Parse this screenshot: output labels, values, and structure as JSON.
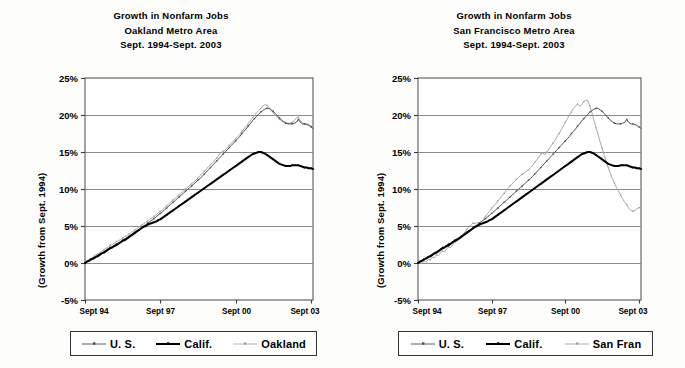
{
  "document": {
    "background_color": "#fdfdfb",
    "ink_color": "#000000"
  },
  "panels": [
    {
      "id": "oakland",
      "title_line1": "Growth in Nonfarm Jobs",
      "title_line2": "Oakland Metro Area",
      "title_line3": "Sept. 1994-Sept. 2003",
      "ylabel": "(Growth from Sept. 1994)",
      "legend": [
        {
          "label": "U. S.",
          "color": "#4d4d4d",
          "width": 0.9,
          "marker": "dot"
        },
        {
          "label": "Calif.",
          "color": "#000000",
          "width": 2.0,
          "marker": "dot"
        },
        {
          "label": "Oakland",
          "color": "#a8a8a8",
          "width": 0.9,
          "marker": "dot"
        }
      ]
    },
    {
      "id": "sanfrancisco",
      "title_line1": "Growth in Nonfarm Jobs",
      "title_line2": "San Francisco Metro Area",
      "title_line3": "Sept. 1994-Sept. 2003",
      "ylabel": "(Growth from Sept. 1994)",
      "legend": [
        {
          "label": "U. S.",
          "color": "#4d4d4d",
          "width": 0.9,
          "marker": "dot"
        },
        {
          "label": "Calif.",
          "color": "#000000",
          "width": 2.0,
          "marker": "dot"
        },
        {
          "label": "San Fran",
          "color": "#a8a8a8",
          "width": 0.9,
          "marker": "dot"
        }
      ]
    }
  ],
  "chart_data": [
    {
      "type": "line",
      "title": "Growth in Nonfarm Jobs Oakland Metro Area Sept. 1994-Sept. 2003",
      "xlabel": "",
      "ylabel": "(Growth from Sept. 1994)",
      "ylim": [
        -5,
        25
      ],
      "yticks": [
        -5,
        0,
        5,
        10,
        15,
        20,
        25
      ],
      "ytick_labels": [
        "-5%",
        "0%",
        "5%",
        "10%",
        "15%",
        "20%",
        "25%"
      ],
      "xticks": [
        0,
        36,
        72,
        108
      ],
      "xtick_labels": [
        "Sept 94",
        "Sept 97",
        "Sept 00",
        "Sept 03"
      ],
      "x_unit": "months since Sept 1994",
      "grid": "horizontal",
      "legend_position": "below",
      "series": [
        {
          "name": "U. S.",
          "color": "#4d4d4d",
          "values": [
            0.0,
            0.2,
            0.4,
            0.5,
            0.7,
            0.9,
            1.0,
            1.2,
            1.4,
            1.5,
            1.7,
            1.9,
            2.1,
            2.2,
            2.4,
            2.6,
            2.7,
            2.9,
            3.1,
            3.3,
            3.4,
            3.6,
            3.8,
            4.0,
            4.2,
            4.4,
            4.6,
            4.8,
            5.0,
            5.2,
            5.4,
            5.6,
            5.8,
            6.0,
            6.2,
            6.5,
            6.7,
            6.9,
            7.2,
            7.4,
            7.7,
            7.9,
            8.2,
            8.4,
            8.7,
            8.9,
            9.2,
            9.4,
            9.7,
            9.9,
            10.2,
            10.4,
            10.7,
            10.9,
            11.2,
            11.4,
            11.7,
            12.0,
            12.3,
            12.6,
            12.9,
            13.2,
            13.5,
            13.8,
            14.1,
            14.4,
            14.7,
            15.0,
            15.3,
            15.6,
            15.9,
            16.2,
            16.5,
            16.8,
            17.1,
            17.5,
            17.8,
            18.1,
            18.5,
            18.8,
            19.2,
            19.5,
            19.8,
            20.1,
            20.4,
            20.6,
            20.8,
            20.9,
            20.9,
            20.7,
            20.5,
            20.2,
            19.9,
            19.6,
            19.3,
            19.1,
            18.9,
            18.8,
            18.8,
            18.8,
            18.9,
            19.0,
            19.4,
            19.0,
            18.8,
            18.8,
            18.7,
            18.6,
            18.4,
            18.2
          ]
        },
        {
          "name": "Calif.",
          "color": "#000000",
          "values": [
            0.0,
            0.2,
            0.3,
            0.5,
            0.6,
            0.8,
            0.9,
            1.1,
            1.3,
            1.4,
            1.6,
            1.8,
            2.0,
            2.1,
            2.3,
            2.4,
            2.6,
            2.8,
            3.0,
            3.1,
            3.3,
            3.5,
            3.7,
            3.9,
            4.1,
            4.3,
            4.5,
            4.7,
            4.9,
            5.0,
            5.2,
            5.3,
            5.4,
            5.5,
            5.6,
            5.8,
            5.9,
            6.1,
            6.3,
            6.5,
            6.7,
            6.9,
            7.1,
            7.3,
            7.5,
            7.7,
            7.9,
            8.1,
            8.3,
            8.5,
            8.7,
            8.9,
            9.1,
            9.3,
            9.5,
            9.7,
            9.9,
            10.1,
            10.3,
            10.5,
            10.7,
            10.9,
            11.1,
            11.3,
            11.5,
            11.7,
            11.9,
            12.1,
            12.3,
            12.5,
            12.7,
            12.9,
            13.1,
            13.3,
            13.5,
            13.7,
            13.9,
            14.1,
            14.3,
            14.5,
            14.7,
            14.8,
            14.9,
            15.0,
            15.0,
            14.9,
            14.8,
            14.6,
            14.4,
            14.2,
            14.0,
            13.8,
            13.6,
            13.4,
            13.3,
            13.2,
            13.1,
            13.1,
            13.1,
            13.2,
            13.2,
            13.2,
            13.2,
            13.1,
            13.0,
            12.9,
            12.9,
            12.8,
            12.8,
            12.7
          ]
        },
        {
          "name": "Oakland",
          "color": "#a8a8a8",
          "values": [
            0.0,
            0.3,
            0.5,
            0.6,
            0.9,
            1.1,
            1.2,
            1.4,
            1.6,
            1.8,
            2.0,
            2.1,
            2.4,
            2.5,
            2.7,
            2.9,
            3.0,
            3.2,
            3.4,
            3.6,
            3.7,
            3.9,
            4.1,
            4.3,
            4.5,
            4.7,
            4.9,
            5.1,
            5.3,
            5.5,
            5.7,
            5.9,
            6.1,
            6.3,
            6.5,
            6.8,
            7.0,
            7.2,
            7.5,
            7.7,
            8.0,
            8.2,
            8.5,
            8.7,
            9.0,
            9.2,
            9.5,
            9.7,
            10.0,
            10.2,
            10.5,
            10.7,
            11.0,
            11.2,
            11.5,
            11.8,
            12.1,
            12.4,
            12.7,
            13.0,
            13.3,
            13.6,
            13.9,
            14.2,
            14.6,
            14.9,
            15.1,
            15.3,
            15.6,
            15.9,
            16.2,
            16.5,
            16.8,
            17.1,
            17.4,
            17.8,
            18.1,
            18.5,
            18.8,
            19.2,
            19.6,
            19.9,
            20.3,
            20.6,
            20.9,
            21.2,
            21.4,
            21.3,
            21.0,
            20.6,
            20.3,
            20.0,
            19.7,
            19.4,
            19.2,
            19.0,
            18.9,
            18.9,
            18.9,
            19.0,
            19.2,
            19.6,
            19.7,
            19.2,
            18.9,
            18.8,
            18.8,
            18.7,
            18.5,
            18.3
          ]
        }
      ]
    },
    {
      "type": "line",
      "title": "Growth in Nonfarm Jobs San Francisco Metro Area Sept. 1994-Sept. 2003",
      "xlabel": "",
      "ylabel": "(Growth from Sept. 1994)",
      "ylim": [
        -5,
        25
      ],
      "yticks": [
        -5,
        0,
        5,
        10,
        15,
        20,
        25
      ],
      "ytick_labels": [
        "-5%",
        "0%",
        "5%",
        "10%",
        "15%",
        "20%",
        "25%"
      ],
      "xticks": [
        0,
        36,
        72,
        108
      ],
      "xtick_labels": [
        "Sept 94",
        "Sept 97",
        "Sept 00",
        "Sept 03"
      ],
      "x_unit": "months since Sept 1994",
      "grid": "horizontal",
      "legend_position": "below",
      "series": [
        {
          "name": "U. S.",
          "color": "#4d4d4d",
          "values": [
            0.0,
            0.2,
            0.4,
            0.5,
            0.7,
            0.9,
            1.0,
            1.2,
            1.4,
            1.5,
            1.7,
            1.9,
            2.1,
            2.2,
            2.4,
            2.6,
            2.7,
            2.9,
            3.1,
            3.3,
            3.4,
            3.6,
            3.8,
            4.0,
            4.2,
            4.4,
            4.6,
            4.8,
            5.0,
            5.2,
            5.4,
            5.6,
            5.8,
            6.0,
            6.2,
            6.5,
            6.7,
            6.9,
            7.2,
            7.4,
            7.7,
            7.9,
            8.2,
            8.4,
            8.7,
            8.9,
            9.2,
            9.4,
            9.7,
            9.9,
            10.2,
            10.4,
            10.7,
            10.9,
            11.2,
            11.4,
            11.7,
            12.0,
            12.3,
            12.6,
            12.9,
            13.2,
            13.5,
            13.8,
            14.1,
            14.4,
            14.7,
            15.0,
            15.3,
            15.6,
            15.9,
            16.2,
            16.5,
            16.8,
            17.1,
            17.5,
            17.8,
            18.1,
            18.5,
            18.8,
            19.2,
            19.5,
            19.8,
            20.1,
            20.4,
            20.6,
            20.8,
            20.9,
            20.9,
            20.7,
            20.5,
            20.2,
            19.9,
            19.6,
            19.3,
            19.1,
            18.9,
            18.8,
            18.8,
            18.8,
            18.9,
            19.0,
            19.4,
            19.0,
            18.8,
            18.8,
            18.7,
            18.6,
            18.4,
            18.2
          ]
        },
        {
          "name": "Calif.",
          "color": "#000000",
          "values": [
            0.0,
            0.2,
            0.3,
            0.5,
            0.6,
            0.8,
            0.9,
            1.1,
            1.3,
            1.4,
            1.6,
            1.8,
            2.0,
            2.1,
            2.3,
            2.4,
            2.6,
            2.8,
            3.0,
            3.1,
            3.3,
            3.5,
            3.7,
            3.9,
            4.1,
            4.3,
            4.5,
            4.7,
            4.9,
            5.0,
            5.2,
            5.3,
            5.4,
            5.5,
            5.6,
            5.8,
            5.9,
            6.1,
            6.3,
            6.5,
            6.7,
            6.9,
            7.1,
            7.3,
            7.5,
            7.7,
            7.9,
            8.1,
            8.3,
            8.5,
            8.7,
            8.9,
            9.1,
            9.3,
            9.5,
            9.7,
            9.9,
            10.1,
            10.3,
            10.5,
            10.7,
            10.9,
            11.1,
            11.3,
            11.5,
            11.7,
            11.9,
            12.1,
            12.3,
            12.5,
            12.7,
            12.9,
            13.1,
            13.3,
            13.5,
            13.7,
            13.9,
            14.1,
            14.3,
            14.5,
            14.7,
            14.8,
            14.9,
            15.0,
            15.0,
            14.9,
            14.8,
            14.6,
            14.4,
            14.2,
            14.0,
            13.8,
            13.6,
            13.4,
            13.3,
            13.2,
            13.1,
            13.1,
            13.1,
            13.2,
            13.2,
            13.2,
            13.2,
            13.1,
            13.0,
            12.9,
            12.9,
            12.8,
            12.8,
            12.7
          ]
        },
        {
          "name": "San Fran",
          "color": "#a8a8a8",
          "values": [
            0.0,
            0.2,
            -0.1,
            0.3,
            0.1,
            0.5,
            0.4,
            0.8,
            0.7,
            1.1,
            1.0,
            1.4,
            1.6,
            1.5,
            1.9,
            2.2,
            2.1,
            2.5,
            2.8,
            3.0,
            3.3,
            3.6,
            3.9,
            4.2,
            4.6,
            4.9,
            5.2,
            5.4,
            5.3,
            5.5,
            5.4,
            5.6,
            5.9,
            6.3,
            6.7,
            7.0,
            7.4,
            7.7,
            8.0,
            8.4,
            8.7,
            9.1,
            9.4,
            9.8,
            10.1,
            10.4,
            10.7,
            11.0,
            11.3,
            11.5,
            11.8,
            12.0,
            12.2,
            12.4,
            12.6,
            12.9,
            13.2,
            13.6,
            13.9,
            14.3,
            14.7,
            14.9,
            14.6,
            15.0,
            15.4,
            15.8,
            16.2,
            16.6,
            17.1,
            17.5,
            18.0,
            18.5,
            19.0,
            19.5,
            20.0,
            20.4,
            20.9,
            21.2,
            21.5,
            21.2,
            21.4,
            21.8,
            22.0,
            21.9,
            21.2,
            20.3,
            19.3,
            18.3,
            17.4,
            16.4,
            15.5,
            14.6,
            13.7,
            12.9,
            12.1,
            11.4,
            10.8,
            10.2,
            9.7,
            9.2,
            8.7,
            8.2,
            7.9,
            7.4,
            7.1,
            7.0,
            7.1,
            7.3,
            7.5,
            7.4
          ]
        }
      ]
    }
  ]
}
